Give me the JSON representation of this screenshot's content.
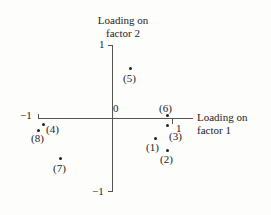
{
  "chart_data": {
    "type": "scatter",
    "title": "",
    "xlabel": "Loading on factor 1",
    "ylabel": "Loading on factor 2",
    "xlim": [
      -1,
      1
    ],
    "ylim": [
      -1,
      1
    ],
    "grid": false,
    "legend": "none",
    "origin_label": "0",
    "x_ticks": [
      {
        "value": -1,
        "label": "−1"
      },
      {
        "value": 1,
        "label": "1"
      }
    ],
    "y_ticks": [
      {
        "value": 1,
        "label": "1"
      },
      {
        "value": -1,
        "label": "−1"
      }
    ],
    "points": [
      {
        "label": "(1)",
        "x": 0.72,
        "y": -0.27,
        "px": 155,
        "py": 138,
        "lx": 146,
        "ly": 142
      },
      {
        "label": "(2)",
        "x": 0.91,
        "y": -0.44,
        "px": 167,
        "py": 150,
        "lx": 160,
        "ly": 154
      },
      {
        "label": "(3)",
        "x": 0.91,
        "y": -0.1,
        "px": 167,
        "py": 125,
        "lx": 169,
        "ly": 131
      },
      {
        "label": "(4)",
        "x": -0.91,
        "y": -0.08,
        "px": 43,
        "py": 124,
        "lx": 46,
        "ly": 124
      },
      {
        "label": "(5)",
        "x": 0.27,
        "y": 0.68,
        "px": 130,
        "py": 68,
        "lx": 123,
        "ly": 73
      },
      {
        "label": "(6)",
        "x": 0.83,
        "y": 0.04,
        "px": 167,
        "py": 115,
        "lx": 159,
        "ly": 103
      },
      {
        "label": "(7)",
        "x": -0.78,
        "y": -0.55,
        "px": 60,
        "py": 158,
        "lx": 53,
        "ly": 163
      },
      {
        "label": "(8)",
        "x": -0.98,
        "y": -0.16,
        "px": 38,
        "py": 130,
        "lx": 31,
        "ly": 133
      }
    ]
  },
  "axes": {
    "y_title_line1": "Loading on",
    "y_title_line2": "factor 2",
    "x_title_line1": "Loading on",
    "x_title_line2": "factor 1"
  },
  "colors": {
    "axis": "#55524f",
    "point": "#222020",
    "background": "#fdfdfc",
    "text": "#1c1c1c"
  }
}
